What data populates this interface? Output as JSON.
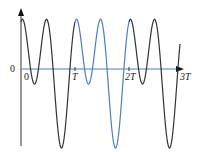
{
  "chart_data": {
    "type": "line",
    "title": "",
    "xlabel": "",
    "ylabel": "",
    "x_ticks": [
      "0",
      "T",
      "2T",
      "3T"
    ],
    "y_ticks": [
      "0"
    ],
    "grid": false,
    "legend": [],
    "function": "f(t) = cos(4πt/T) + 0.68·sin(2πt/T)",
    "x_range_periods": [
      0,
      3
    ],
    "highlighted_interval": {
      "from": "T",
      "to": "2T",
      "color": "#4a7fc1"
    },
    "series": [
      {
        "name": "waveform",
        "color": "#333333",
        "highlight_color": "#4a7fc1",
        "key_points": [
          {
            "t": "0",
            "y": 1.0
          },
          {
            "t": "T/4",
            "y": -0.32
          },
          {
            "t": "T/2",
            "y": 1.0
          },
          {
            "t": "3T/4",
            "y": -1.68
          },
          {
            "t": "T",
            "y": 1.0
          }
        ]
      }
    ]
  },
  "labels": {
    "y_origin": "0",
    "x_origin": "0",
    "t1": "T",
    "t2": "2T",
    "t3": "3T"
  },
  "colors": {
    "axis_x": "#4a7fc1",
    "axis_y": "#333333",
    "curve": "#333333",
    "highlight": "#4a7fc1"
  }
}
